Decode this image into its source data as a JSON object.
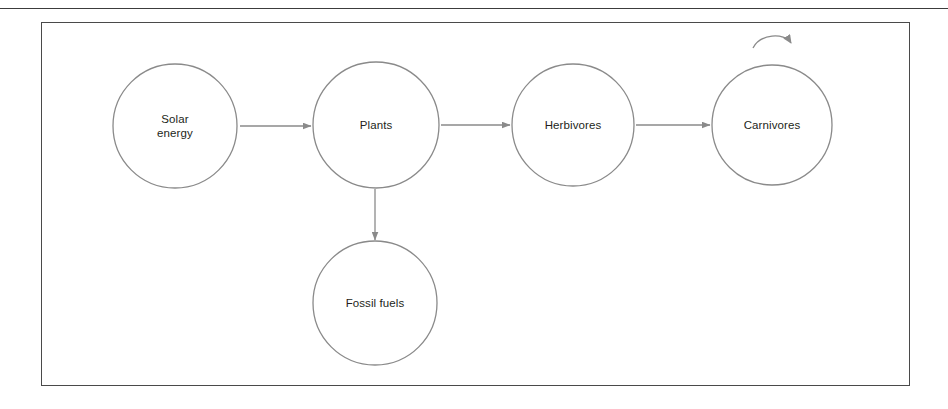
{
  "page": {
    "background_color": "#ffffff",
    "top_rule_color": "#3c3c3c",
    "frame_border_color": "#4a4a4a",
    "stroke_color": "#8a8a8a",
    "text_color": "#231f20"
  },
  "diagram": {
    "type": "flow-diagram",
    "nodes": [
      {
        "id": "solar-energy",
        "label": "Solar\nenergy",
        "shape": "circle",
        "cx": 175,
        "cy": 126,
        "r": 62
      },
      {
        "id": "plants",
        "label": "Plants",
        "shape": "circle",
        "cx": 376,
        "cy": 125,
        "r": 63
      },
      {
        "id": "herbivores",
        "label": "Herbivores",
        "shape": "circle",
        "cx": 573,
        "cy": 125,
        "r": 61
      },
      {
        "id": "carnivores",
        "label": "Carnivores",
        "shape": "circle",
        "cx": 772,
        "cy": 125,
        "r": 60
      },
      {
        "id": "fossil-fuels",
        "label": "Fossil fuels",
        "shape": "circle",
        "cx": 375,
        "cy": 303,
        "r": 62
      }
    ],
    "edges": [
      {
        "id": "solar-to-plants",
        "from": "solar-energy",
        "to": "plants",
        "direction": "right"
      },
      {
        "id": "plants-to-herbivores",
        "from": "plants",
        "to": "herbivores",
        "direction": "right"
      },
      {
        "id": "herbivores-to-carnivores",
        "from": "herbivores",
        "to": "carnivores",
        "direction": "right"
      },
      {
        "id": "plants-to-fossil-fuels",
        "from": "plants",
        "to": "fossil-fuels",
        "direction": "down"
      },
      {
        "id": "carnivores-self-loop",
        "from": "carnivores",
        "to": "carnivores",
        "direction": "self-loop"
      }
    ]
  }
}
